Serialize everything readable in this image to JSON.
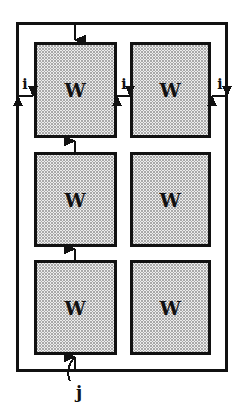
{
  "figure": {
    "kind": "block-diagram",
    "background_color": "#ffffff",
    "line_color": "#111111",
    "cell_fill_color": "#d9d9d9",
    "cell_fill_pattern": "halftone-checker",
    "frame": {
      "name": "outer-frame",
      "x": 16,
      "y": 22,
      "width": 212,
      "height": 350,
      "stroke_width": 3
    },
    "cells": [
      {
        "id": "cell-r1c1",
        "label": "W",
        "row": 1,
        "col": 1,
        "x": 34,
        "y": 42,
        "width": 83,
        "height": 96
      },
      {
        "id": "cell-r1c2",
        "label": "W",
        "row": 1,
        "col": 2,
        "x": 130,
        "y": 42,
        "width": 81,
        "height": 96
      },
      {
        "id": "cell-r2c1",
        "label": "W",
        "row": 2,
        "col": 1,
        "x": 34,
        "y": 152,
        "width": 83,
        "height": 95
      },
      {
        "id": "cell-r2c2",
        "label": "W",
        "row": 2,
        "col": 2,
        "x": 130,
        "y": 152,
        "width": 81,
        "height": 95
      },
      {
        "id": "cell-r3c1",
        "label": "W",
        "row": 3,
        "col": 1,
        "x": 34,
        "y": 260,
        "width": 83,
        "height": 95
      },
      {
        "id": "cell-r3c2",
        "label": "W",
        "row": 3,
        "col": 2,
        "x": 130,
        "y": 260,
        "width": 81,
        "height": 95
      }
    ],
    "dimension_labels": [
      {
        "id": "dim-i-left",
        "text": "i",
        "x": 25,
        "y": 84,
        "arrow": "double-horizontal",
        "arrow_from_x": 17,
        "arrow_to_x": 33,
        "arrow_y": 96
      },
      {
        "id": "dim-i-middle",
        "text": "i",
        "x": 124,
        "y": 84,
        "arrow": "double-horizontal",
        "arrow_from_x": 117,
        "arrow_to_x": 130,
        "arrow_y": 96
      },
      {
        "id": "dim-i-right",
        "text": "i",
        "x": 220,
        "y": 84,
        "arrow": "double-horizontal",
        "arrow_from_x": 212,
        "arrow_to_x": 228,
        "arrow_y": 96
      }
    ],
    "pitch_label": {
      "id": "dim-j",
      "text": "j",
      "x": 79,
      "y": 392
    },
    "connectors": [
      {
        "id": "arrow-top-into-row1",
        "orientation": "vertical",
        "x": 75,
        "from_y": 23,
        "to_y": 42,
        "head": "down"
      },
      {
        "id": "arrow-row2-to-row1",
        "orientation": "vertical",
        "x": 75,
        "from_y": 152,
        "to_y": 139,
        "head": "up"
      },
      {
        "id": "arrow-row3-to-row2",
        "orientation": "vertical",
        "x": 75,
        "from_y": 260,
        "to_y": 247,
        "head": "up"
      },
      {
        "id": "arrow-bottom-to-row3",
        "orientation": "vertical",
        "x": 75,
        "from_y": 372,
        "to_y": 356,
        "head": "up"
      },
      {
        "id": "leader-hook-j",
        "orientation": "curve",
        "note": "curved hook leader from bottom frame edge down to the j label"
      }
    ]
  }
}
